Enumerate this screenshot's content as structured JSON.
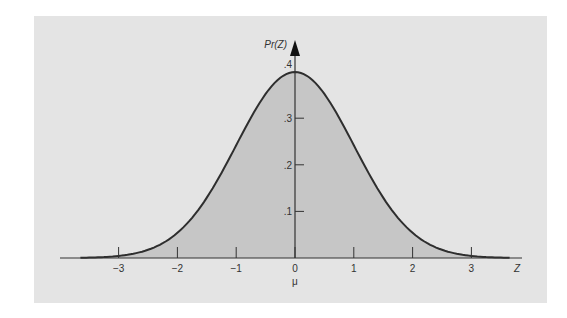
{
  "chart_data": {
    "type": "area",
    "title": "",
    "xlabel": "Z",
    "ylabel": "Pr(Z)",
    "mean_label": "μ",
    "distribution": "standard normal",
    "x_ticks": [
      -3,
      -2,
      -1,
      0,
      1,
      2,
      3
    ],
    "x_tick_labels": [
      "−3",
      "−2",
      "−1",
      "0",
      "1",
      "2",
      "3"
    ],
    "y_ticks": [
      0.1,
      0.2,
      0.3,
      0.4
    ],
    "y_tick_labels": [
      ".1",
      ".2",
      ".3",
      ".4"
    ],
    "xlim": [
      -3.9,
      3.9
    ],
    "ylim": [
      0,
      0.42
    ],
    "shaded_range": [
      -3,
      3
    ],
    "curve_range": [
      -3.65,
      3.65
    ],
    "x": [
      -3.5,
      -3,
      -2.5,
      -2,
      -1.5,
      -1,
      -0.5,
      0,
      0.5,
      1,
      1.5,
      2,
      2.5,
      3,
      3.5
    ],
    "values": [
      0.0009,
      0.0044,
      0.0175,
      0.054,
      0.1295,
      0.242,
      0.3521,
      0.3989,
      0.3521,
      0.242,
      0.1295,
      0.054,
      0.0175,
      0.0044,
      0.0009
    ],
    "grid": false,
    "legend": null
  },
  "colors": {
    "panel_bg": "#e4e4e4",
    "shade": "#c6c6c6",
    "curve": "#2e2e2e",
    "axis": "#333333"
  }
}
